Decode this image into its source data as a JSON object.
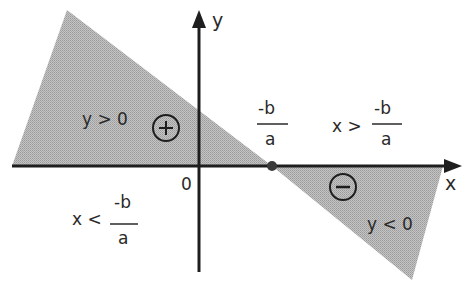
{
  "diagram": {
    "type": "sign-of-linear-function",
    "axes": {
      "x_label": "x",
      "y_label": "y",
      "origin_label": "0"
    },
    "root": {
      "numerator": "-b",
      "denominator": "a"
    },
    "regions": {
      "positive": {
        "condition": "y > 0",
        "sign_symbol": "+",
        "x_condition_prefix": "x <",
        "x_condition_numerator": "-b",
        "x_condition_denominator": "a"
      },
      "negative": {
        "condition": "y < 0",
        "sign_symbol": "−",
        "x_condition_prefix": "x >",
        "x_condition_numerator": "-b",
        "x_condition_denominator": "a"
      }
    },
    "colors": {
      "fill": "#b8b8b8",
      "axis": "#1e1e1e",
      "text": "#2a2a2a",
      "background": "#ffffff"
    }
  }
}
